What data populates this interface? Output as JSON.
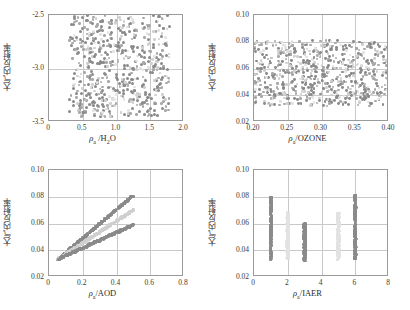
{
  "figure": {
    "ylabel_cn": "大气内反射率",
    "marker_colors": {
      "dark": "#8a8a8a",
      "mid": "#a8a8a8",
      "light": "#cfcfcf",
      "faint": "#e2e2e2",
      "axis": "#9a9a9a",
      "grid": "#c9c9c9"
    }
  },
  "chart_data": [
    {
      "type": "scatter",
      "panel": "top-left",
      "title": "",
      "xlabel": "ρa /H2O",
      "xlabel_symbol": "ρ",
      "xlabel_sub": "a",
      "xlabel_rest": "/H",
      "xlabel_rest_sub": "2",
      "xlabel_tail": "O",
      "ylabel": "大气内反射率",
      "xlim": [
        0,
        2.0
      ],
      "ylim": [
        -3.5,
        -2.5
      ],
      "y_inverted": true,
      "grid": true,
      "xticks": [
        0,
        0.5,
        1.0,
        1.5,
        2.0
      ],
      "xticklabels": [
        "0",
        "0.5",
        "1.0",
        "1.5",
        "2.0"
      ],
      "yticks": [
        -2.5,
        -3.0,
        -3.5
      ],
      "yticklabels": [
        "-2.5",
        "-3.0",
        "-3.5"
      ],
      "data_x_range": [
        0.3,
        1.78
      ],
      "data_y_range": [
        -3.45,
        -2.5
      ],
      "n_points": 620,
      "description": "dense unstructured cloud of dark and light gray points filling x 0.3-1.78, y -3.45 to -2.5"
    },
    {
      "type": "scatter",
      "panel": "top-right",
      "title": "",
      "xlabel": "ρa /OZONE",
      "xlabel_symbol": "ρ",
      "xlabel_sub": "a",
      "xlabel_rest": "/OZONE",
      "ylabel": "大气内反射率",
      "xlim": [
        0.2,
        0.4
      ],
      "ylim": [
        0.02,
        0.1
      ],
      "y_inverted": false,
      "grid": true,
      "xticks": [
        0.2,
        0.25,
        0.3,
        0.35,
        0.4
      ],
      "xticklabels": [
        "0.20",
        "0.25",
        "0.30",
        "0.35",
        "0.40"
      ],
      "yticks": [
        0.02,
        0.04,
        0.06,
        0.08,
        0.1
      ],
      "yticklabels": [
        "0.02",
        "0.04",
        "0.06",
        "0.08",
        "0.10"
      ],
      "data_x_range": [
        0.2,
        0.4
      ],
      "data_y_range": [
        0.032,
        0.081
      ],
      "n_points": 700,
      "description": "horizontal dense band of points spanning full x range, y clipped between 0.032 and 0.081"
    },
    {
      "type": "scatter",
      "panel": "bottom-left",
      "title": "",
      "xlabel": "ρa /AOD",
      "xlabel_symbol": "ρ",
      "xlabel_sub": "a",
      "xlabel_rest": "/AOD",
      "ylabel": "大气内反射率",
      "xlim": [
        0,
        0.8
      ],
      "ylim": [
        0.02,
        0.1
      ],
      "y_inverted": false,
      "grid": true,
      "xticks": [
        0,
        0.2,
        0.4,
        0.6,
        0.8
      ],
      "xticklabels": [
        "0",
        "0.2",
        "0.4",
        "0.6",
        "0.8"
      ],
      "yticks": [
        0.02,
        0.04,
        0.06,
        0.08,
        0.1
      ],
      "yticklabels": [
        "0.02",
        "0.04",
        "0.06",
        "0.08",
        "0.10"
      ],
      "series": [
        {
          "name": "upper-band",
          "shade": "dark",
          "x": [
            0.05,
            0.5
          ],
          "y": [
            0.033,
            0.081
          ]
        },
        {
          "name": "middle-band",
          "shade": "light",
          "x": [
            0.05,
            0.5
          ],
          "y": [
            0.033,
            0.07
          ]
        },
        {
          "name": "lower-band",
          "shade": "dark",
          "x": [
            0.05,
            0.5
          ],
          "y": [
            0.033,
            0.059
          ]
        }
      ],
      "description": "three near-linear rising point bands emerging from a common origin near (0.05,0.033) and fanning out to 0.081, 0.070 and 0.059 at x=0.50"
    },
    {
      "type": "scatter",
      "panel": "bottom-right",
      "title": "",
      "xlabel": "ρa /IAER",
      "xlabel_symbol": "ρ",
      "xlabel_sub": "a",
      "xlabel_rest": "/IAER",
      "ylabel": "大气内反射率",
      "xlim": [
        0,
        8
      ],
      "ylim": [
        0.02,
        0.1
      ],
      "y_inverted": false,
      "grid": true,
      "xticks": [
        0,
        2,
        4,
        6,
        8
      ],
      "xticklabels": [
        "0",
        "2",
        "4",
        "6",
        "8"
      ],
      "yticks": [
        0.02,
        0.04,
        0.06,
        0.08,
        0.1
      ],
      "yticklabels": [
        "0.02",
        "0.04",
        "0.06",
        "0.08",
        "0.10"
      ],
      "strips": [
        {
          "x": 1,
          "y_min": 0.033,
          "y_max": 0.08,
          "shade": "dark"
        },
        {
          "x": 2,
          "y_min": 0.033,
          "y_max": 0.068,
          "shade": "faint"
        },
        {
          "x": 3,
          "y_min": 0.032,
          "y_max": 0.06,
          "shade": "dark"
        },
        {
          "x": 5,
          "y_min": 0.033,
          "y_max": 0.068,
          "shade": "faint"
        },
        {
          "x": 6,
          "y_min": 0.033,
          "y_max": 0.081,
          "shade": "dark"
        }
      ],
      "description": "discrete vertical point columns at integer aerosol model indices 1,2,3,5,6 with differing vertical extents"
    }
  ]
}
